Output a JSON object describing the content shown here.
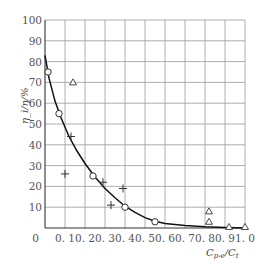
{
  "chart_data": {
    "type": "scatter",
    "title": "",
    "xlabel": "C_p-e/C_t",
    "ylabel": "η_i/η/%",
    "xlim": [
      0,
      1.0
    ],
    "ylim": [
      0,
      100
    ],
    "grid": true,
    "x_ticks": [
      "0",
      "0.1",
      "0.2",
      "0.3",
      "0.4",
      "0.5",
      "0.6",
      "0.7",
      "0.8",
      "0.9",
      "1.0"
    ],
    "y_ticks": [
      "10",
      "20",
      "30",
      "40",
      "50",
      "60",
      "70",
      "80",
      "90",
      "100"
    ],
    "series": [
      {
        "name": "circles",
        "marker": "circle",
        "points": [
          [
            0.015,
            75
          ],
          [
            0.07,
            55
          ],
          [
            0.24,
            25
          ],
          [
            0.4,
            10
          ],
          [
            0.55,
            3
          ]
        ]
      },
      {
        "name": "plus",
        "marker": "plus",
        "points": [
          [
            0.1,
            26
          ],
          [
            0.13,
            44
          ],
          [
            0.29,
            22
          ],
          [
            0.33,
            11
          ],
          [
            0.39,
            19
          ]
        ]
      },
      {
        "name": "triangles",
        "marker": "triangle",
        "points": [
          [
            0.14,
            70
          ],
          [
            0.82,
            8
          ],
          [
            0.82,
            3
          ],
          [
            0.92,
            0.5
          ],
          [
            1.0,
            0.5
          ]
        ]
      },
      {
        "name": "fit-curve",
        "marker": "line",
        "points": [
          [
            0.0,
            83
          ],
          [
            0.02,
            72
          ],
          [
            0.05,
            61
          ],
          [
            0.08,
            53
          ],
          [
            0.12,
            44
          ],
          [
            0.16,
            37
          ],
          [
            0.2,
            31
          ],
          [
            0.25,
            24.5
          ],
          [
            0.3,
            19
          ],
          [
            0.35,
            14.5
          ],
          [
            0.4,
            10.5
          ],
          [
            0.45,
            7.5
          ],
          [
            0.5,
            5
          ],
          [
            0.55,
            3.2
          ],
          [
            0.6,
            2.2
          ],
          [
            0.7,
            1.2
          ],
          [
            0.8,
            0.6
          ],
          [
            0.9,
            0.2
          ],
          [
            1.0,
            0
          ]
        ]
      }
    ]
  },
  "axis": {
    "x_label_main": "C",
    "x_label_sub1": "p-e",
    "x_label_slash": "/C",
    "x_label_sub2": "t",
    "y_label": "η_i/η/%",
    "origin": "0"
  }
}
